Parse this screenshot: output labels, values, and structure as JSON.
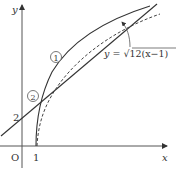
{
  "diagram": {
    "axes": {
      "x_label": "x",
      "y_label": "y",
      "origin_label": "O",
      "x_tick_label": "1",
      "y_tick_label": "2"
    },
    "curves": [
      {
        "id": "1",
        "marker": "①",
        "style": "solid",
        "description": "curve ① from (1,0), concave"
      },
      {
        "id": "2",
        "marker": "②",
        "style": "solid",
        "description": "straight line ② with y-intercept 2"
      },
      {
        "id": "dashed",
        "style": "dashed",
        "equation": "y=√12(x−1)"
      }
    ],
    "equation_label": {
      "prefix": "y = ",
      "radical": "√",
      "radicand": "12(x−1)"
    },
    "colors": {
      "stroke": "#333333",
      "background": "#ffffff"
    }
  }
}
